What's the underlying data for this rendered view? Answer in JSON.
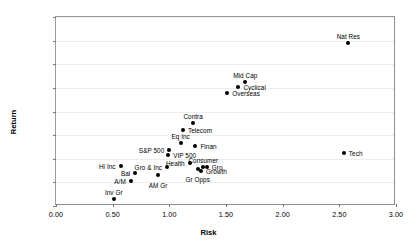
{
  "chart_data": {
    "type": "scatter",
    "title": "",
    "xlabel": "Risk",
    "ylabel": "Return",
    "xlim": [
      0,
      3
    ],
    "ylim": [
      0,
      40
    ],
    "xticks": [
      "0.00",
      "0.50",
      "1.00",
      "1.50",
      "2.00",
      "2.50",
      "3.00"
    ],
    "xtick_values": [
      0,
      0.5,
      1,
      1.5,
      2,
      2.5,
      3
    ],
    "yticks": [
      "0.00",
      "5.00",
      "10.00",
      "15.00",
      "20.00",
      "25.00",
      "30.00",
      "35.00",
      "40.00"
    ],
    "ytick_values": [
      0,
      5,
      10,
      15,
      20,
      25,
      30,
      35,
      40
    ],
    "grid": "horizontal",
    "legend": "none",
    "marker_color": "#000000",
    "points": [
      {
        "label": "Nat Res",
        "x": 2.58,
        "y": 34.6,
        "pos": "above"
      },
      {
        "label": "Mid Cap",
        "x": 1.67,
        "y": 26.3,
        "pos": "above"
      },
      {
        "label": "Cyclical",
        "x": 1.61,
        "y": 25.1,
        "pos": "right"
      },
      {
        "label": "Overseas",
        "x": 1.51,
        "y": 23.9,
        "pos": "right"
      },
      {
        "label": "Contra",
        "x": 1.21,
        "y": 17.6,
        "pos": "above"
      },
      {
        "label": "Telecom",
        "x": 1.12,
        "y": 16.0,
        "pos": "right"
      },
      {
        "label": "Eq Inc",
        "x": 1.1,
        "y": 13.3,
        "pos": "above"
      },
      {
        "label": "Finan",
        "x": 1.23,
        "y": 12.6,
        "pos": "right"
      },
      {
        "label": "S&P 500",
        "x": 1.0,
        "y": 11.8,
        "pos": "left"
      },
      {
        "label": "VIP 500",
        "x": 0.99,
        "y": 10.7,
        "pos": "right"
      },
      {
        "label": "Tech",
        "x": 2.54,
        "y": 11.3,
        "pos": "right"
      },
      {
        "label": "Health",
        "x": 1.18,
        "y": 9.1,
        "pos": "left"
      },
      {
        "label": "Consumer",
        "x": 1.3,
        "y": 8.3,
        "pos": "above"
      },
      {
        "label": "Gro",
        "x": 1.33,
        "y": 8.2,
        "pos": "right"
      },
      {
        "label": "Gr Opps",
        "x": 1.25,
        "y": 7.9,
        "pos": "below"
      },
      {
        "label": "Growth",
        "x": 1.28,
        "y": 7.5,
        "pos": "right"
      },
      {
        "label": "Gro & Inc",
        "x": 0.98,
        "y": 8.2,
        "pos": "left"
      },
      {
        "label": "Hi Inc",
        "x": 0.57,
        "y": 8.4,
        "pos": "left"
      },
      {
        "label": "Bal",
        "x": 0.7,
        "y": 6.9,
        "pos": "left"
      },
      {
        "label": "AM Gr",
        "x": 0.9,
        "y": 6.5,
        "pos": "below"
      },
      {
        "label": "A/M",
        "x": 0.66,
        "y": 5.3,
        "pos": "left"
      },
      {
        "label": "Inv Gr",
        "x": 0.51,
        "y": 1.4,
        "pos": "above"
      }
    ]
  }
}
